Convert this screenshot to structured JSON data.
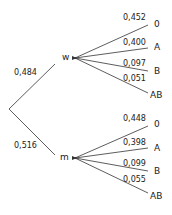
{
  "tree": {
    "root": {
      "branches": [
        {
          "label": "w",
          "probability": "0,484",
          "children": [
            {
              "label": "0",
              "probability": "0,452"
            },
            {
              "label": "A",
              "probability": "0,400"
            },
            {
              "label": "B",
              "probability": "0,097"
            },
            {
              "label": "AB",
              "probability": "0,051"
            }
          ]
        },
        {
          "label": "m",
          "probability": "0,516",
          "children": [
            {
              "label": "0",
              "probability": "0,448"
            },
            {
              "label": "A",
              "probability": "0,398"
            },
            {
              "label": "B",
              "probability": "0,099"
            },
            {
              "label": "AB",
              "probability": "0,055"
            }
          ]
        }
      ]
    }
  },
  "colors": {
    "line": "#333333",
    "text": "#222222"
  }
}
